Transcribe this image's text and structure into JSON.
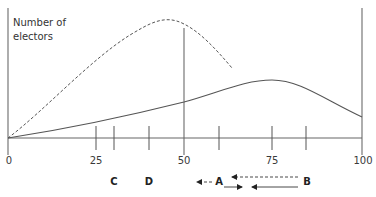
{
  "diagram": {
    "y_axis_label_line1": "Number of",
    "y_axis_label_line2": "electors",
    "x_axis": {
      "min": 0,
      "max": 100,
      "tick_labels": [
        "0",
        "25",
        "50",
        "75",
        "100"
      ]
    },
    "position_labels": {
      "C": "C",
      "D": "D",
      "A": "A",
      "B": "B"
    },
    "curves": [
      {
        "name": "dashed-distribution",
        "style": "dashed",
        "peak_x": 42
      },
      {
        "name": "solid-distribution",
        "style": "solid",
        "peak_x": 73
      }
    ],
    "arrows": [
      {
        "name": "a-leftward-dashed",
        "style": "dashed",
        "direction": "left",
        "label_side": "A"
      },
      {
        "name": "b-leftward-dashed",
        "style": "dashed",
        "direction": "left",
        "label_side": "B"
      },
      {
        "name": "a-rightward-solid",
        "style": "solid",
        "direction": "right",
        "label_side": "A"
      },
      {
        "name": "b-leftward-solid",
        "style": "solid",
        "direction": "left",
        "label_side": "B"
      }
    ],
    "colors": {
      "line": "#555555",
      "axis": "#666666",
      "text": "#333333"
    }
  }
}
